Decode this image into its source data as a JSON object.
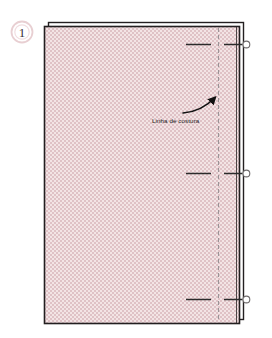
{
  "figure": {
    "kind": "sewing-pattern-diagram",
    "background_color": "#ffffff"
  },
  "step_marker": {
    "label": "1",
    "shape": "circle",
    "ring_color": "#e8cfd2",
    "text_color": "#3c3033",
    "center_x": 22,
    "center_y": 32,
    "radius": 11
  },
  "fabric_panel": {
    "name": "fabric-piece",
    "fill_color": "#f0dcdd",
    "hatch_color": "#d9b9bd",
    "outline_color": "#231f20",
    "x": 44,
    "y": 26,
    "width": 196,
    "height": 298
  },
  "outer_outline": {
    "name": "fold-allowance-outline",
    "stroke_color": "#231f20",
    "x": 48,
    "y": 22,
    "width": 196,
    "height": 298
  },
  "seam_line": {
    "label": "Linha de costura",
    "stroke_color": "#9a9396",
    "dash_pattern": "4 3",
    "x": 218,
    "y_top": 28,
    "y_bottom": 322
  },
  "arrow": {
    "name": "seam-line-pointer",
    "stroke_color": "#111111",
    "from_x": 182,
    "from_y": 112,
    "to_x": 216,
    "to_y": 97
  },
  "label": {
    "text": "Linha de costura",
    "x": 152,
    "y": 121,
    "color": "#1a1a1a"
  },
  "notches": [
    {
      "name": "notch-top",
      "y": 44,
      "dash_x1": 186,
      "dash_x2": 211,
      "tick_x1": 224,
      "tick_x2": 243,
      "circle_x": 246,
      "circle_r": 3.4,
      "stroke_color": "#2b2b2b"
    },
    {
      "name": "notch-middle",
      "y": 173,
      "dash_x1": 186,
      "dash_x2": 211,
      "tick_x1": 224,
      "tick_x2": 243,
      "circle_x": 246,
      "circle_r": 3.4,
      "stroke_color": "#2b2b2b"
    },
    {
      "name": "notch-bottom",
      "y": 299,
      "dash_x1": 186,
      "dash_x2": 211,
      "tick_x1": 224,
      "tick_x2": 243,
      "circle_x": 246,
      "circle_r": 3.4,
      "stroke_color": "#2b2b2b"
    }
  ],
  "colors": {
    "fabric_fill": "#f0dcdd",
    "fabric_hatch": "#d9b9bd",
    "outline": "#231f20",
    "seam_dash": "#9a9396",
    "marker_ring": "#e8cfd2",
    "ink": "#111111"
  }
}
